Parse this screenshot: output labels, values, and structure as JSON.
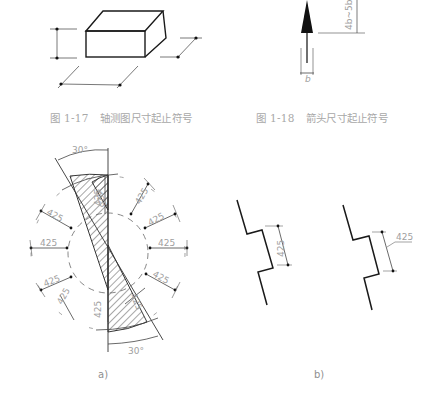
{
  "figures": {
    "fig_1_17": {
      "number": "图 1-17",
      "title": "轴测图尺寸起止符号"
    },
    "fig_1_18": {
      "number": "图 1-18",
      "title": "箭头尺寸起止符号",
      "arrow_length_label": "4b~5b",
      "arrow_width_label": "b"
    },
    "fig_a": {
      "label": "a)",
      "angle_top": "30°",
      "angle_bottom": "30°",
      "dimension_value": "425",
      "dimensions": [
        "425",
        "425",
        "425",
        "425",
        "425",
        "425",
        "425",
        "425",
        "425",
        "425",
        "425",
        "425"
      ]
    },
    "fig_b": {
      "label": "b)",
      "left_dimension": "425",
      "right_dimension": "425"
    }
  },
  "colors": {
    "line": "#1a1a1a",
    "dim_line": "#444444",
    "text": "#a0a0a0"
  }
}
